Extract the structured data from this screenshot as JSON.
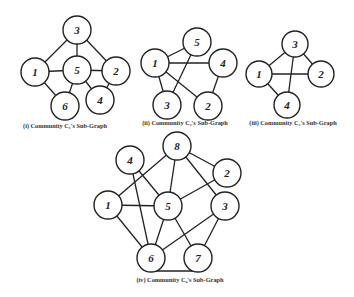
{
  "figure": {
    "stroke_color": "#222222",
    "background": "#ffffff",
    "graphs": [
      {
        "id": "c1",
        "caption": "(i) Community C₁'s Sub-Graph",
        "caption_pos": [
          65,
          128
        ],
        "radius": 14,
        "nodes": [
          {
            "label": "3",
            "x": 77,
            "y": 30
          },
          {
            "label": "1",
            "x": 35,
            "y": 72
          },
          {
            "label": "5",
            "x": 77,
            "y": 70
          },
          {
            "label": "2",
            "x": 116,
            "y": 71
          },
          {
            "label": "6",
            "x": 65,
            "y": 106
          },
          {
            "label": "4",
            "x": 100,
            "y": 100
          }
        ],
        "edges": [
          [
            "3",
            "1"
          ],
          [
            "3",
            "5"
          ],
          [
            "3",
            "2"
          ],
          [
            "1",
            "5"
          ],
          [
            "5",
            "2"
          ],
          [
            "1",
            "6"
          ],
          [
            "5",
            "6"
          ],
          [
            "5",
            "4"
          ],
          [
            "2",
            "4"
          ]
        ]
      },
      {
        "id": "c2",
        "caption": "(ii) Community C₂'s Sub-Graph",
        "caption_pos": [
          185,
          125
        ],
        "radius": 14,
        "nodes": [
          {
            "label": "5",
            "x": 197,
            "y": 42
          },
          {
            "label": "1",
            "x": 155,
            "y": 63
          },
          {
            "label": "4",
            "x": 223,
            "y": 63
          },
          {
            "label": "3",
            "x": 167,
            "y": 105
          },
          {
            "label": "2",
            "x": 208,
            "y": 106
          }
        ],
        "edges": [
          [
            "1",
            "5"
          ],
          [
            "1",
            "4"
          ],
          [
            "1",
            "3"
          ],
          [
            "1",
            "2"
          ],
          [
            "5",
            "3"
          ],
          [
            "4",
            "2"
          ]
        ]
      },
      {
        "id": "c3",
        "caption": "(iii) Community C₃'s Sub-Graph",
        "caption_pos": [
          293,
          125
        ],
        "radius": 13,
        "nodes": [
          {
            "label": "3",
            "x": 295,
            "y": 44
          },
          {
            "label": "1",
            "x": 259,
            "y": 74
          },
          {
            "label": "2",
            "x": 321,
            "y": 74
          },
          {
            "label": "4",
            "x": 287,
            "y": 105
          }
        ],
        "edges": [
          [
            "3",
            "1"
          ],
          [
            "3",
            "2"
          ],
          [
            "3",
            "4"
          ],
          [
            "1",
            "2"
          ],
          [
            "1",
            "4"
          ]
        ]
      },
      {
        "id": "c4",
        "caption": "(iv) Community C₄'s Sub-Graph",
        "caption_pos": [
          180,
          282
        ],
        "radius": 14,
        "nodes": [
          {
            "label": "8",
            "x": 177,
            "y": 146
          },
          {
            "label": "4",
            "x": 130,
            "y": 160
          },
          {
            "label": "2",
            "x": 227,
            "y": 173
          },
          {
            "label": "1",
            "x": 108,
            "y": 205
          },
          {
            "label": "5",
            "x": 168,
            "y": 206
          },
          {
            "label": "3",
            "x": 225,
            "y": 206
          },
          {
            "label": "6",
            "x": 151,
            "y": 258
          },
          {
            "label": "7",
            "x": 198,
            "y": 258
          }
        ],
        "edges": [
          [
            "8",
            "1"
          ],
          [
            "8",
            "5"
          ],
          [
            "8",
            "2"
          ],
          [
            "8",
            "3"
          ],
          [
            "4",
            "5"
          ],
          [
            "4",
            "6"
          ],
          [
            "1",
            "5"
          ],
          [
            "1",
            "6"
          ],
          [
            "5",
            "6"
          ],
          [
            "5",
            "7"
          ],
          [
            "2",
            "5"
          ],
          [
            "3",
            "6"
          ],
          [
            "3",
            "7"
          ],
          [
            "6",
            "7"
          ]
        ]
      }
    ]
  }
}
